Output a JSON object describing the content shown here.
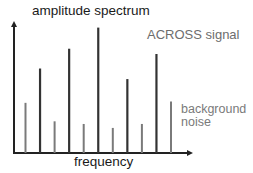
{
  "chart_data": {
    "type": "bar",
    "style": "stem",
    "title": "amplitude spectrum",
    "xlabel": "frequency",
    "ylabel": "",
    "ylim": [
      0,
      100
    ],
    "grid": false,
    "annotations": [
      {
        "text": "ACROSS signal",
        "refers_to": "ACROSS signal"
      },
      {
        "text": "background noise",
        "refers_to": "background noise"
      }
    ],
    "colors": {
      "axis": "#222222",
      "ACROSS signal": "#333333",
      "background noise": "#7a7a7a"
    },
    "categories": [
      1,
      2,
      3,
      4,
      5,
      6,
      7,
      8,
      9,
      10,
      11
    ],
    "series": [
      {
        "name": "background noise",
        "x": [
          1,
          3,
          5,
          7,
          9,
          11
        ],
        "values": [
          38,
          24,
          22,
          19,
          22,
          39
        ]
      },
      {
        "name": "ACROSS signal",
        "x": [
          2,
          4,
          6,
          8,
          10
        ],
        "values": [
          64,
          79,
          95,
          56,
          75
        ]
      }
    ]
  },
  "labels": {
    "title": "amplitude spectrum",
    "xlabel": "frequency",
    "signal": "ACROSS signal",
    "noise_line1": "background",
    "noise_line2": "noise"
  }
}
